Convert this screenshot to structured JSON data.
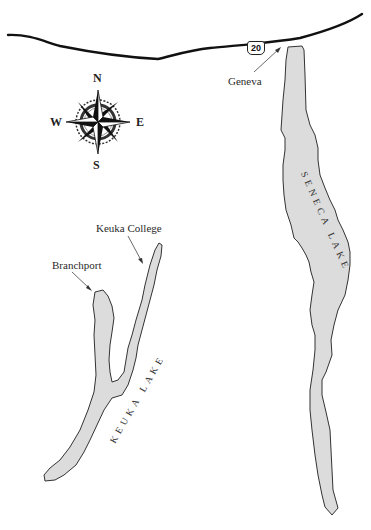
{
  "map": {
    "highway": {
      "label": "20",
      "type": "us-route-shield"
    },
    "compass": {
      "n": "N",
      "s": "S",
      "e": "E",
      "w": "W"
    },
    "places": {
      "geneva": "Geneva",
      "keuka_college": "Keuka College",
      "branchport": "Branchport"
    },
    "lakes": {
      "seneca": "SENECA LAKE",
      "keuka": "KEUKA LAKE"
    },
    "colors": {
      "lake_fill": "#dcdcdc",
      "outline": "#333333",
      "road": "#111111",
      "background": "#ffffff"
    }
  }
}
